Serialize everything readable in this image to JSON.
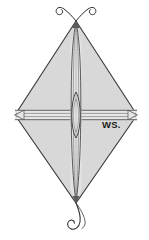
{
  "figure": {
    "background_color": "#ffffff"
  },
  "labels": {
    "ws": "WS."
  },
  "colors": {
    "sail_fill": "#d8d8d8",
    "sail_outline": "#3a3a3a",
    "spar_stroke": "#4a4a4a",
    "spar_highlight": "#f2f2f2",
    "tail_stroke": "#2b2b2b",
    "label_color": "#1a1a1a"
  },
  "geometry": {
    "apex_top": "76,21",
    "vertex_left": "15,115",
    "vertex_right": "137,115",
    "vertex_bottom": "76,203",
    "spine_orientation": "vertical",
    "spreader_orientation": "horizontal",
    "center_lens": "76,115"
  },
  "parts": {
    "sail": "kite-sail",
    "spine": "vertical-spar",
    "spreader": "horizontal-spar",
    "center_joint": "spar-crossing-lens",
    "top_tails": "two curled streamers",
    "bottom_tail": "single curled streamer"
  }
}
